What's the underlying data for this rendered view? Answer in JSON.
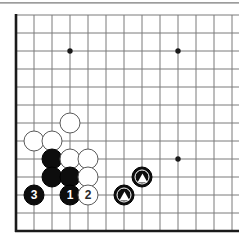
{
  "figure": {
    "kind": "go-board-diagram",
    "board_size": 19,
    "view": "bottom-left-corner",
    "colors": {
      "line": "#7a7a7a",
      "border": "#1a1a1a",
      "black_stone": "#0d0d0d",
      "white_stone": "#ffffff",
      "white_stone_outline": "#5a5a5a",
      "background": "#ffffff",
      "top_rule": "#8d8d8d"
    },
    "geometry": {
      "origin_x": 16,
      "origin_y": 7,
      "spacing": 18,
      "cols": 13,
      "rows": 12,
      "stone_diameter": 21
    }
  },
  "grid": {
    "star_points": [
      {
        "col": 3,
        "row": 2,
        "name": "star-point-upper-left"
      },
      {
        "col": 9,
        "row": 2,
        "name": "star-point-upper-right"
      },
      {
        "col": 9,
        "row": 8,
        "name": "star-point-lower-right"
      }
    ]
  },
  "stones": [
    {
      "id": "w-a",
      "color": "white",
      "col": 1,
      "row": 7,
      "label": "",
      "mark": "none",
      "name": "white-stone"
    },
    {
      "id": "w-b",
      "color": "white",
      "col": 2,
      "row": 7,
      "label": "",
      "mark": "none",
      "name": "white-stone"
    },
    {
      "id": "w-c",
      "color": "white",
      "col": 3,
      "row": 6,
      "label": "",
      "mark": "none",
      "name": "white-stone"
    },
    {
      "id": "b-a",
      "color": "black",
      "col": 2,
      "row": 8,
      "label": "",
      "mark": "none",
      "name": "black-stone"
    },
    {
      "id": "w-d",
      "color": "white",
      "col": 3,
      "row": 8,
      "label": "",
      "mark": "none",
      "name": "white-stone"
    },
    {
      "id": "w-e",
      "color": "white",
      "col": 4,
      "row": 8,
      "label": "",
      "mark": "none",
      "name": "white-stone"
    },
    {
      "id": "b-b",
      "color": "black",
      "col": 2,
      "row": 9,
      "label": "",
      "mark": "none",
      "name": "black-stone"
    },
    {
      "id": "b-c",
      "color": "black",
      "col": 3,
      "row": 9,
      "label": "",
      "mark": "none",
      "name": "black-stone"
    },
    {
      "id": "w-f",
      "color": "white",
      "col": 4,
      "row": 9,
      "label": "",
      "mark": "none",
      "name": "white-stone"
    },
    {
      "id": "m-3",
      "color": "black",
      "col": 1,
      "row": 10,
      "label": "3",
      "mark": "none",
      "name": "move-stone-3"
    },
    {
      "id": "m-1",
      "color": "black",
      "col": 3,
      "row": 10,
      "label": "1",
      "mark": "none",
      "name": "move-stone-1"
    },
    {
      "id": "m-2",
      "color": "white",
      "col": 4,
      "row": 10,
      "label": "2",
      "mark": "none",
      "name": "move-stone-2"
    },
    {
      "id": "t-1",
      "color": "black",
      "col": 7,
      "row": 9,
      "label": "",
      "mark": "triangle",
      "name": "marked-black-stone-triangle"
    },
    {
      "id": "t-2",
      "color": "black",
      "col": 6,
      "row": 10,
      "label": "",
      "mark": "triangle",
      "name": "marked-black-stone-triangle"
    }
  ],
  "move_numbers": [
    "1",
    "2",
    "3"
  ]
}
